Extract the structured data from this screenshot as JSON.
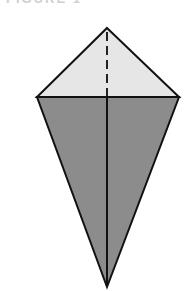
{
  "caption": {
    "text": "FIGURE 1"
  },
  "diagram": {
    "type": "origami-kite-base",
    "colors": {
      "top_flap": "#e6e6e6",
      "bottom_body": "#8c8c8c",
      "outline": "#111111"
    },
    "vertices": {
      "top": [
        107,
        28
      ],
      "left": [
        37,
        97
      ],
      "right": [
        179,
        97
      ],
      "bottom": [
        107,
        287
      ]
    },
    "lines": {
      "center_fold_top": "dashed (valley fold)",
      "center_fold_bottom": "solid",
      "horizontal_edge": "solid"
    }
  }
}
